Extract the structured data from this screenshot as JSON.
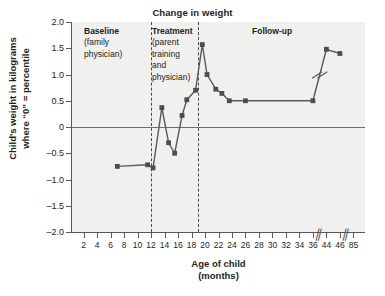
{
  "chart_data": {
    "type": "line",
    "title": "Change in weight",
    "xlabel": "Age of child",
    "xlabel_sub": "(months)",
    "ylabel": "Child's weight in kilograms",
    "ylabel_sub": "where “0” = percentile",
    "grid": false,
    "legend": "none",
    "ylim": [
      -2.0,
      2.0
    ],
    "yticks": [
      2.0,
      1.5,
      1.0,
      0.5,
      0,
      -0.5,
      -1.0,
      -1.5,
      -2.0
    ],
    "ytick_labels": [
      "2.0",
      "1.5",
      "1.0",
      "0.5",
      "0",
      "–0.5",
      "–1.0",
      "–1.5",
      "–2.0"
    ],
    "xticks": [
      2,
      4,
      6,
      8,
      10,
      12,
      14,
      16,
      18,
      20,
      22,
      24,
      26,
      28,
      30,
      32,
      34,
      36,
      44,
      46,
      85
    ],
    "xtick_labels": [
      "2",
      "4",
      "6",
      "8",
      "10",
      "12",
      "14",
      "16",
      "18",
      "20",
      "22",
      "24",
      "26",
      "28",
      "30",
      "32",
      "34",
      "36",
      "44",
      "46",
      "85"
    ],
    "axis_breaks_after": [
      36,
      46
    ],
    "series": [
      {
        "name": "Child's weight change",
        "x": [
          7,
          11.5,
          12.3,
          13.6,
          14.6,
          15.5,
          16.6,
          17.3,
          18.6,
          19.6,
          20.3,
          21.6,
          22.5,
          23.6,
          26,
          36,
          44,
          46
        ],
        "y": [
          -0.75,
          -0.72,
          -0.78,
          0.37,
          -0.3,
          -0.5,
          0.22,
          0.52,
          0.7,
          1.57,
          1.0,
          0.72,
          0.64,
          0.5,
          0.5,
          0.5,
          1.48,
          1.4
        ]
      }
    ],
    "phases": [
      {
        "id": "baseline",
        "heading": "Baseline",
        "sub": [
          "(family",
          "physician)"
        ],
        "start": 2,
        "end": 12
      },
      {
        "id": "treatment",
        "heading": "Treatment",
        "sub": [
          "(parent",
          "training",
          "and",
          "physician)"
        ],
        "start": 12,
        "end": 19
      },
      {
        "id": "followup",
        "heading": "Follow-up",
        "sub": [],
        "start": 19,
        "end": 85
      }
    ],
    "phase_dividers": [
      12,
      19
    ],
    "colors": {
      "plot_background": "#f0f0ee",
      "axis": "#58595b",
      "series_line": "#58595b",
      "marker": "#4d4d4f",
      "zero_line": "#6d6e71",
      "text": "#231f20",
      "divider": "#4a4a4a"
    }
  }
}
